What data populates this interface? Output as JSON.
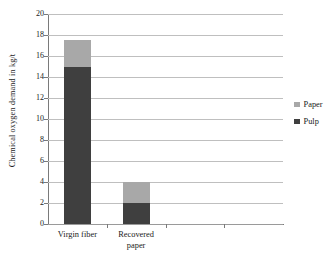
{
  "chart_data": {
    "type": "bar",
    "subtype": "stacked-bar",
    "title": "",
    "xlabel": "",
    "ylabel": "Chemical oxygen demand in kg/t",
    "categories": [
      "Virgin fiber",
      "Recovered paper"
    ],
    "category_label_lines": [
      [
        "Virgin fiber"
      ],
      [
        "Recovered",
        "paper"
      ]
    ],
    "series": [
      {
        "name": "Pulp",
        "values": [
          15,
          2
        ],
        "color": "#3f3f3f"
      },
      {
        "name": "Paper",
        "values": [
          2.5,
          2
        ],
        "color": "#a8a8a8"
      }
    ],
    "stack_order_bottom_to_top": [
      "Pulp",
      "Paper"
    ],
    "totals": [
      17.5,
      4
    ],
    "ylim": [
      0,
      20
    ],
    "ytick_step": 2,
    "yticks": [
      "0",
      "2",
      "4",
      "6",
      "8",
      "10",
      "12",
      "14",
      "16",
      "18",
      "20"
    ],
    "grid": {
      "horizontal": true,
      "vertical": false
    },
    "legend": {
      "position": "right",
      "entries": [
        {
          "label": "Paper",
          "color": "#a8a8a8"
        },
        {
          "label": "Pulp",
          "color": "#3f3f3f"
        }
      ]
    },
    "empty_category_slots": 2,
    "colors": {
      "paper": "#a8a8a8",
      "pulp": "#3f3f3f",
      "gridline": "#bfbfbf",
      "axis": "#7a7a7a",
      "text": "#1a1a1a",
      "background": "#ffffff"
    }
  }
}
